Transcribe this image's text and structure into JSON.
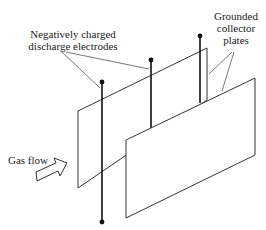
{
  "labels": {
    "electrodes": [
      "Negatively charged",
      "discharge electrodes"
    ],
    "plates": [
      "Grounded",
      "collector",
      "plates"
    ],
    "gas_flow": "Gas flow"
  },
  "components": {
    "collector_plates": 2,
    "discharge_electrodes": 3
  },
  "colors": {
    "line": "#333333",
    "electrode": "#111111",
    "background": "#ffffff"
  }
}
